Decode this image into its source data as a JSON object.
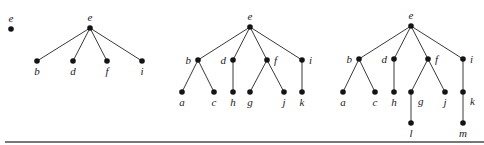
{
  "diagram": {
    "type": "rooted-tree-growth-sequence",
    "colors": {
      "node": "#141414",
      "edge": "#3a3a3a",
      "label": "#222222",
      "rule": "#4a4a4a"
    },
    "trees": [
      {
        "id": "tree-1",
        "nodes": [
          {
            "id": "e",
            "label": "e",
            "x": 11,
            "y": 29,
            "lx": 11,
            "ly": 22,
            "anchor": "middle"
          }
        ],
        "edges": []
      },
      {
        "id": "tree-2",
        "nodes": [
          {
            "id": "e",
            "label": "e",
            "x": 90,
            "y": 28,
            "lx": 90,
            "ly": 21,
            "anchor": "middle"
          },
          {
            "id": "b",
            "label": "b",
            "x": 37,
            "y": 61,
            "lx": 37,
            "ly": 75,
            "anchor": "middle"
          },
          {
            "id": "d",
            "label": "d",
            "x": 73,
            "y": 61,
            "lx": 73,
            "ly": 75,
            "anchor": "middle"
          },
          {
            "id": "f",
            "label": "f",
            "x": 107,
            "y": 61,
            "lx": 107,
            "ly": 75,
            "anchor": "middle"
          },
          {
            "id": "i",
            "label": "i",
            "x": 142,
            "y": 61,
            "lx": 142,
            "ly": 75,
            "anchor": "middle"
          }
        ],
        "edges": [
          [
            "e",
            "b"
          ],
          [
            "e",
            "d"
          ],
          [
            "e",
            "f"
          ],
          [
            "e",
            "i"
          ]
        ]
      },
      {
        "id": "tree-3",
        "nodes": [
          {
            "id": "e",
            "label": "e",
            "x": 250,
            "y": 27,
            "lx": 250,
            "ly": 20,
            "anchor": "middle"
          },
          {
            "id": "b",
            "label": "b",
            "x": 198,
            "y": 60,
            "lx": 191,
            "ly": 64,
            "anchor": "end"
          },
          {
            "id": "d",
            "label": "d",
            "x": 233,
            "y": 60,
            "lx": 226,
            "ly": 64,
            "anchor": "end"
          },
          {
            "id": "f",
            "label": "f",
            "x": 267,
            "y": 60,
            "lx": 274,
            "ly": 64,
            "anchor": "start"
          },
          {
            "id": "i",
            "label": "i",
            "x": 302,
            "y": 60,
            "lx": 309,
            "ly": 64,
            "anchor": "start"
          },
          {
            "id": "a",
            "label": "a",
            "x": 182,
            "y": 92,
            "lx": 182,
            "ly": 106,
            "anchor": "middle"
          },
          {
            "id": "c",
            "label": "c",
            "x": 214,
            "y": 92,
            "lx": 214,
            "ly": 106,
            "anchor": "middle"
          },
          {
            "id": "h",
            "label": "h",
            "x": 233,
            "y": 92,
            "lx": 233,
            "ly": 106,
            "anchor": "middle"
          },
          {
            "id": "g",
            "label": "g",
            "x": 250,
            "y": 92,
            "lx": 250,
            "ly": 106,
            "anchor": "middle"
          },
          {
            "id": "j",
            "label": "j",
            "x": 284,
            "y": 92,
            "lx": 284,
            "ly": 106,
            "anchor": "middle"
          },
          {
            "id": "k",
            "label": "k",
            "x": 302,
            "y": 92,
            "lx": 302,
            "ly": 106,
            "anchor": "middle"
          }
        ],
        "edges": [
          [
            "e",
            "b"
          ],
          [
            "e",
            "d"
          ],
          [
            "e",
            "f"
          ],
          [
            "e",
            "i"
          ],
          [
            "b",
            "a"
          ],
          [
            "b",
            "c"
          ],
          [
            "d",
            "h"
          ],
          [
            "f",
            "g"
          ],
          [
            "f",
            "j"
          ],
          [
            "i",
            "k"
          ]
        ]
      },
      {
        "id": "tree-4",
        "nodes": [
          {
            "id": "e",
            "label": "e",
            "x": 411,
            "y": 26,
            "lx": 411,
            "ly": 19,
            "anchor": "middle"
          },
          {
            "id": "b",
            "label": "b",
            "x": 359,
            "y": 59,
            "lx": 352,
            "ly": 63,
            "anchor": "end"
          },
          {
            "id": "d",
            "label": "d",
            "x": 394,
            "y": 59,
            "lx": 387,
            "ly": 63,
            "anchor": "end"
          },
          {
            "id": "f",
            "label": "f",
            "x": 428,
            "y": 59,
            "lx": 435,
            "ly": 63,
            "anchor": "start"
          },
          {
            "id": "i",
            "label": "i",
            "x": 463,
            "y": 59,
            "lx": 470,
            "ly": 63,
            "anchor": "start"
          },
          {
            "id": "a",
            "label": "a",
            "x": 343,
            "y": 92,
            "lx": 343,
            "ly": 106,
            "anchor": "middle"
          },
          {
            "id": "c",
            "label": "c",
            "x": 375,
            "y": 92,
            "lx": 375,
            "ly": 106,
            "anchor": "middle"
          },
          {
            "id": "h",
            "label": "h",
            "x": 394,
            "y": 92,
            "lx": 394,
            "ly": 106,
            "anchor": "middle"
          },
          {
            "id": "g",
            "label": "g",
            "x": 411,
            "y": 92,
            "lx": 418,
            "ly": 105,
            "anchor": "start"
          },
          {
            "id": "j",
            "label": "j",
            "x": 445,
            "y": 92,
            "lx": 445,
            "ly": 106,
            "anchor": "middle"
          },
          {
            "id": "k",
            "label": "k",
            "x": 463,
            "y": 92,
            "lx": 470,
            "ly": 105,
            "anchor": "start"
          },
          {
            "id": "l",
            "label": "l",
            "x": 411,
            "y": 123,
            "lx": 411,
            "ly": 137,
            "anchor": "middle"
          },
          {
            "id": "m",
            "label": "m",
            "x": 463,
            "y": 123,
            "lx": 463,
            "ly": 137,
            "anchor": "middle"
          }
        ],
        "edges": [
          [
            "e",
            "b"
          ],
          [
            "e",
            "d"
          ],
          [
            "e",
            "f"
          ],
          [
            "e",
            "i"
          ],
          [
            "b",
            "a"
          ],
          [
            "b",
            "c"
          ],
          [
            "d",
            "h"
          ],
          [
            "f",
            "g"
          ],
          [
            "f",
            "j"
          ],
          [
            "i",
            "k"
          ],
          [
            "g",
            "l"
          ],
          [
            "k",
            "m"
          ]
        ]
      }
    ],
    "rule": {
      "x1": 5,
      "x2": 484,
      "y": 142
    }
  }
}
